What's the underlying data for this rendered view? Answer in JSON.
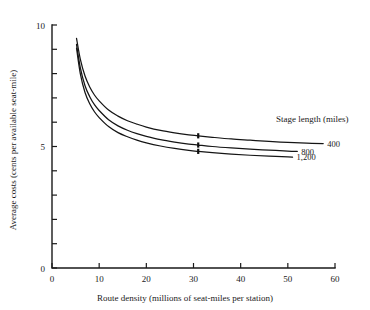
{
  "chart_data": {
    "type": "line",
    "title": "",
    "xlabel": "Route density (millions of seat-miles per station)",
    "ylabel": "Average costs (cents per available seat-mile)",
    "xlim": [
      0,
      60
    ],
    "ylim": [
      0,
      10
    ],
    "xticks": [
      0,
      10,
      20,
      30,
      40,
      50,
      60
    ],
    "xtick_labels": [
      "0",
      "10",
      "20",
      "30",
      "40",
      "50",
      "60"
    ],
    "yticks": [
      0,
      1,
      2,
      3,
      4,
      5,
      6,
      7,
      8,
      9,
      10
    ],
    "ytick_labels": [
      "0",
      "",
      "",
      "",
      "",
      "5",
      "",
      "",
      "",
      "",
      "10"
    ],
    "grid": false,
    "legend_title": "Stage length (miles)",
    "legend_position": "right-inline",
    "series": [
      {
        "name": "400",
        "label": "400",
        "x": [
          5.2,
          6,
          7,
          8,
          9,
          10,
          12,
          14,
          16,
          18,
          20,
          23,
          26,
          29,
          31,
          34,
          38,
          42,
          46,
          50,
          54,
          57.5
        ],
        "y": [
          9.45,
          8.6,
          7.9,
          7.45,
          7.12,
          6.88,
          6.5,
          6.25,
          6.06,
          5.92,
          5.8,
          5.66,
          5.56,
          5.48,
          5.44,
          5.38,
          5.31,
          5.26,
          5.21,
          5.17,
          5.14,
          5.12
        ]
      },
      {
        "name": "800",
        "label": "800",
        "x": [
          5.2,
          6,
          7,
          8,
          9,
          10,
          12,
          14,
          16,
          18,
          20,
          23,
          26,
          29,
          31,
          34,
          38,
          42,
          46,
          50,
          52
        ],
        "y": [
          9.2,
          8.25,
          7.5,
          7.05,
          6.72,
          6.48,
          6.1,
          5.85,
          5.67,
          5.53,
          5.42,
          5.28,
          5.18,
          5.1,
          5.06,
          5.0,
          4.94,
          4.89,
          4.85,
          4.81,
          4.8
        ]
      },
      {
        "name": "1,200",
        "label": "1,200",
        "x": [
          5.2,
          6,
          7,
          8,
          9,
          10,
          12,
          14,
          16,
          18,
          20,
          23,
          26,
          29,
          31,
          34,
          38,
          42,
          46,
          50,
          51
        ],
        "y": [
          9.05,
          8.0,
          7.22,
          6.76,
          6.43,
          6.19,
          5.82,
          5.57,
          5.4,
          5.26,
          5.15,
          5.02,
          4.92,
          4.84,
          4.8,
          4.75,
          4.69,
          4.64,
          4.6,
          4.57,
          4.56
        ]
      }
    ],
    "markers": [
      {
        "series": "400",
        "x": 31,
        "y": 5.44
      },
      {
        "series": "800",
        "x": 31,
        "y": 5.06
      },
      {
        "series": "1,200",
        "x": 31,
        "y": 4.8
      }
    ]
  }
}
